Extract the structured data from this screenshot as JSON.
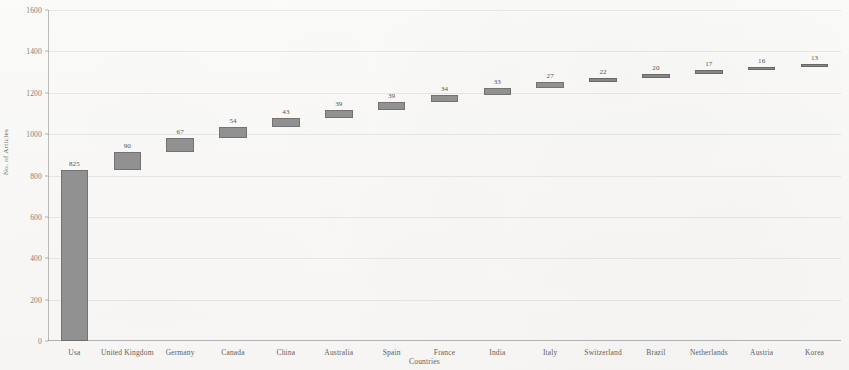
{
  "chart_data": {
    "type": "bar",
    "subtype": "waterfall-cumulative",
    "title": "",
    "xlabel": "Countries",
    "ylabel": "No. of Articles",
    "ylim": [
      0,
      1600
    ],
    "yticks": [
      0,
      200,
      400,
      600,
      800,
      1000,
      1200,
      1400,
      1600
    ],
    "ytick_labels": [
      "0",
      "200",
      "400",
      "600",
      "800",
      "1000",
      "1200",
      "1400",
      "1600"
    ],
    "grid": true,
    "legend": false,
    "legend_position": "none",
    "bar_color": "#8a8a8a",
    "bar_border_color": "#6a6a6a",
    "categories": [
      "Usa",
      "United Kingdom",
      "Germany",
      "Canada",
      "China",
      "Australia",
      "Spain",
      "France",
      "India",
      "Italy",
      "Switzerland",
      "Brazil",
      "Netherlands",
      "Austria",
      "Korea"
    ],
    "values": [
      825,
      90,
      67,
      54,
      43,
      39,
      39,
      34,
      33,
      27,
      22,
      20,
      17,
      16,
      13
    ],
    "data_labels": [
      "825",
      "90",
      "67",
      "54",
      "43",
      "39",
      "39",
      "34",
      "33",
      "27",
      "22",
      "20",
      "17",
      "16",
      "13"
    ],
    "bases": [
      0,
      825,
      915,
      982,
      1036,
      1079,
      1118,
      1157,
      1191,
      1224,
      1251,
      1273,
      1293,
      1310,
      1326
    ],
    "cumulative": [
      825,
      915,
      982,
      1036,
      1079,
      1118,
      1157,
      1191,
      1224,
      1251,
      1273,
      1293,
      1310,
      1326,
      1339
    ]
  }
}
